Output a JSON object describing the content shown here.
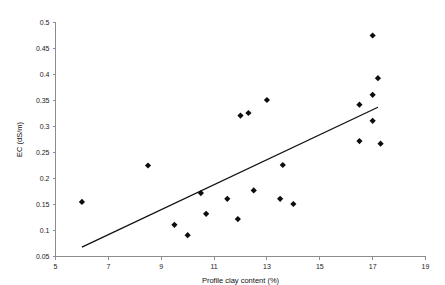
{
  "chart_data": {
    "type": "scatter",
    "title": "",
    "xlabel": "Profile clay content (%)",
    "ylabel": "EC (dS/m)",
    "xlim": [
      5,
      19
    ],
    "ylim": [
      0.05,
      0.5
    ],
    "xticks": [
      5,
      7,
      9,
      11,
      13,
      15,
      17,
      19
    ],
    "yticks": [
      0.05,
      0.1,
      0.15,
      0.2,
      0.25,
      0.3,
      0.35,
      0.4,
      0.45,
      0.5
    ],
    "xtick_labels": [
      "5",
      "7",
      "9",
      "11",
      "13",
      "15",
      "17",
      "19"
    ],
    "ytick_labels": [
      "0.05",
      "0.1",
      "0.15",
      "0.2",
      "0.25",
      "0.3",
      "0.35",
      "0.4",
      "0.45",
      "0.5"
    ],
    "grid": false,
    "legend": false,
    "marker": "diamond",
    "marker_color": "#0d0d0d",
    "series": [
      {
        "name": "EC vs profile clay content",
        "x": [
          6.0,
          8.5,
          9.5,
          10.0,
          10.5,
          10.7,
          11.5,
          11.9,
          12.0,
          12.3,
          12.5,
          13.0,
          13.5,
          13.6,
          14.0,
          16.5,
          16.5,
          17.0,
          17.0,
          17.0,
          17.2,
          17.3
        ],
        "y": [
          0.155,
          0.225,
          0.111,
          0.091,
          0.172,
          0.132,
          0.161,
          0.122,
          0.321,
          0.326,
          0.177,
          0.351,
          0.161,
          0.226,
          0.151,
          0.342,
          0.272,
          0.475,
          0.361,
          0.311,
          0.393,
          0.267
        ]
      }
    ],
    "trendline": {
      "type": "linear",
      "x": [
        6.0,
        17.2
      ],
      "y": [
        0.068,
        0.337
      ],
      "color": "#111111"
    }
  }
}
